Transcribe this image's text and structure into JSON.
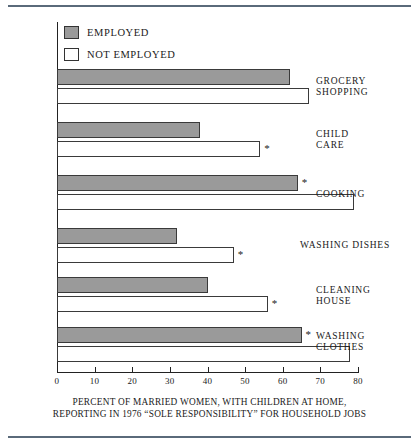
{
  "chart_data": {
    "type": "bar",
    "orientation": "horizontal",
    "title": "",
    "caption_line1": "PERCENT OF MARRIED WOMEN, WITH CHILDREN AT HOME,",
    "caption_line2": "REPORTING IN 1976 “SOLE RESPONSIBILITY” FOR HOUSEHOLD JOBS",
    "xlabel": "",
    "ylabel": "",
    "xlim": [
      0,
      80
    ],
    "xticks": [
      0,
      10,
      20,
      30,
      40,
      50,
      60,
      70,
      80
    ],
    "xticklabels": [
      "0",
      "10",
      "20",
      "30",
      "40",
      "50",
      "60",
      "70",
      "80"
    ],
    "grid": false,
    "legend_position": "top-left",
    "categories": [
      "GROCERY\nSHOPPING",
      "CHILD\nCARE",
      "COOKING",
      "WASHING DISHES",
      "CLEANING\nHOUSE",
      "WASHING\nCLOTHES"
    ],
    "series": [
      {
        "name": "EMPLOYED",
        "color": "#9a9a9a",
        "values": [
          62,
          38,
          64,
          32,
          40,
          65
        ],
        "significance_marks": [
          false,
          false,
          true,
          false,
          false,
          true
        ]
      },
      {
        "name": "NOT EMPLOYED",
        "color": "#ffffff",
        "values": [
          67,
          54,
          79,
          47,
          56,
          78
        ],
        "significance_marks": [
          false,
          true,
          false,
          true,
          true,
          false
        ]
      }
    ],
    "significance_symbol": "*"
  },
  "legend": {
    "items": [
      {
        "label": "EMPLOYED",
        "swatch": "gray-filled"
      },
      {
        "label": "NOT EMPLOYED",
        "swatch": "white-outline"
      }
    ]
  }
}
